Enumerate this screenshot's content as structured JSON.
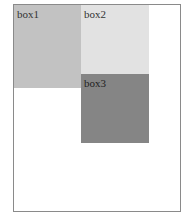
{
  "boxes": [
    {
      "label": "box1",
      "color": "#c2c2c2"
    },
    {
      "label": "box2",
      "color": "#e2e2e2"
    },
    {
      "label": "box3",
      "color": "#858585"
    }
  ]
}
